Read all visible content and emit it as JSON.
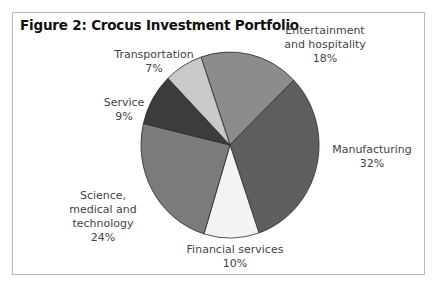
{
  "chart_data": {
    "type": "pie",
    "title": "Figure 2: Crocus Investment Portfolio",
    "categories": [
      "Entertainment and hospitality",
      "Manufacturing",
      "Financial services",
      "Science, medical and technology",
      "Service",
      "Transportation"
    ],
    "values": [
      18,
      32,
      10,
      24,
      9,
      7
    ],
    "unit": "%",
    "colors": [
      "#8c8c8c",
      "#5f5f5f",
      "#f3f3f3",
      "#7b7b7b",
      "#3c3c3c",
      "#c9c9c9"
    ],
    "start_angle_deg": -19,
    "direction": "clockwise",
    "legend": "none (direct labels)"
  },
  "labels": {
    "entertainment": {
      "lines": [
        "Entertainment",
        "and hospitality"
      ],
      "pct": "18%"
    },
    "manufacturing": {
      "lines": [
        "Manufacturing"
      ],
      "pct": "32%"
    },
    "financial": {
      "lines": [
        "Financial services"
      ],
      "pct": "10%"
    },
    "science": {
      "lines": [
        "Science,",
        "medical and",
        "technology"
      ],
      "pct": "24%"
    },
    "service": {
      "lines": [
        "Service"
      ],
      "pct": "9%"
    },
    "transportation": {
      "lines": [
        "Transportation"
      ],
      "pct": "7%"
    }
  }
}
